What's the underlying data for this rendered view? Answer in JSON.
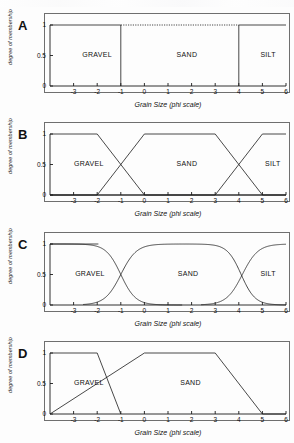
{
  "figure": {
    "background": "#fdfdfd",
    "line_color": "#1a1a1a",
    "frame_color": "#6f6f6f"
  },
  "axis": {
    "xlabel": "Grain Size (phi scale)",
    "ylabel": "degree of membership",
    "xticks": [
      "-3",
      "-2",
      "-1",
      "0",
      "1",
      "2",
      "3",
      "4",
      "5",
      "6"
    ],
    "xtick_values": [
      -3,
      -2,
      -1,
      0,
      1,
      2,
      3,
      4,
      5,
      6
    ],
    "yticks": [
      "0",
      "0.5",
      "1"
    ],
    "ytick_values": [
      0,
      0.5,
      1
    ],
    "xlim": [
      -4,
      6
    ],
    "ylim": [
      0,
      1
    ]
  },
  "panels": [
    {
      "id": "A",
      "letter": "A",
      "labels": [
        {
          "text": "GRAVEL",
          "x": -2.55,
          "y": 0.5
        },
        {
          "text": "SAND",
          "x": 1.45,
          "y": 0.5
        },
        {
          "text": "SILT",
          "x": 5.0,
          "y": 0.5
        }
      ]
    },
    {
      "id": "B",
      "letter": "B",
      "labels": [
        {
          "text": "GRAVEL",
          "x": -2.9,
          "y": 0.5
        },
        {
          "text": "SAND",
          "x": 1.45,
          "y": 0.5
        },
        {
          "text": "SILT",
          "x": 5.2,
          "y": 0.5
        }
      ]
    },
    {
      "id": "C",
      "letter": "C",
      "labels": [
        {
          "text": "GRAVEL",
          "x": -2.85,
          "y": 0.5
        },
        {
          "text": "SAND",
          "x": 1.5,
          "y": 0.5
        },
        {
          "text": "SILT",
          "x": 5.0,
          "y": 0.5
        }
      ]
    },
    {
      "id": "D",
      "letter": "D",
      "labels": [
        {
          "text": "GRAVEL",
          "x": -2.9,
          "y": 0.5
        },
        {
          "text": "SAND",
          "x": 1.6,
          "y": 0.5
        }
      ]
    }
  ],
  "chart_data": [
    {
      "type": "line",
      "panel": "A",
      "title": "A",
      "xlabel": "Grain Size (phi scale)",
      "ylabel": "degree of membership",
      "xlim": [
        -4,
        6
      ],
      "ylim": [
        0,
        1
      ],
      "grid": false,
      "legend": "none",
      "description": "Crisp (boolean) membership functions: rectangular sets with abrupt boundaries at -1 and 4 phi.",
      "series": [
        {
          "name": "GRAVEL",
          "style": "solid",
          "points": [
            [
              -4,
              1
            ],
            [
              -1,
              1
            ],
            [
              -1,
              0
            ],
            [
              6,
              0
            ]
          ]
        },
        {
          "name": "SAND",
          "style": "dotted-top",
          "points": [
            [
              -4,
              0
            ],
            [
              -1,
              0
            ],
            [
              -1,
              1
            ],
            [
              4,
              1
            ],
            [
              4,
              0
            ],
            [
              6,
              0
            ]
          ]
        },
        {
          "name": "SILT",
          "style": "solid",
          "points": [
            [
              -4,
              0
            ],
            [
              4,
              0
            ],
            [
              4,
              1
            ],
            [
              6,
              1
            ]
          ]
        }
      ]
    },
    {
      "type": "line",
      "panel": "B",
      "title": "B",
      "xlabel": "Grain Size (phi scale)",
      "ylabel": "degree of membership",
      "xlim": [
        -4,
        6
      ],
      "ylim": [
        0,
        1
      ],
      "grid": false,
      "legend": "none",
      "description": "Linear (trapezoidal) fuzzy membership functions with linear transition zones -2 to 0 and 3 to 5 phi.",
      "series": [
        {
          "name": "GRAVEL",
          "style": "solid",
          "points": [
            [
              -4,
              1
            ],
            [
              -2,
              1
            ],
            [
              0,
              0
            ],
            [
              6,
              0
            ]
          ]
        },
        {
          "name": "SAND",
          "style": "solid",
          "points": [
            [
              -4,
              0
            ],
            [
              -2,
              0
            ],
            [
              0,
              1
            ],
            [
              3,
              1
            ],
            [
              5,
              0
            ],
            [
              6,
              0
            ]
          ]
        },
        {
          "name": "SILT",
          "style": "solid",
          "points": [
            [
              -4,
              0
            ],
            [
              3,
              0
            ],
            [
              5,
              1
            ],
            [
              6,
              1
            ]
          ]
        }
      ]
    },
    {
      "type": "line",
      "panel": "C",
      "title": "C",
      "xlabel": "Grain Size (phi scale)",
      "ylabel": "degree of membership",
      "xlim": [
        -4,
        6
      ],
      "ylim": [
        0,
        1
      ],
      "grid": false,
      "legend": "none",
      "description": "Sigmoidal (S-shaped) fuzzy membership functions; crossovers at 0.5 membership near -1 and 4 phi.",
      "series": [
        {
          "name": "GRAVEL",
          "style": "sigmoid-falling",
          "crossover": -1.0,
          "slope": 3.2,
          "plateau_end": -1.9,
          "zero_at": 1.0
        },
        {
          "name": "SAND",
          "style": "sigmoid-bell",
          "rise_crossover": -1.0,
          "fall_crossover": 4.1,
          "rise_slope": 3.0,
          "fall_slope": 3.4,
          "plateau": [
            0.6,
            3.5
          ]
        },
        {
          "name": "SILT",
          "style": "sigmoid-rising",
          "crossover": 4.15,
          "slope": 3.0,
          "zero_at": 3.0,
          "plateau_start": 5.4
        }
      ]
    },
    {
      "type": "line",
      "panel": "D",
      "title": "D",
      "xlabel": "Grain Size (phi scale)",
      "ylabel": "degree of membership",
      "xlim": [
        -4,
        6
      ],
      "ylim": [
        0,
        1
      ],
      "grid": false,
      "legend": "none",
      "description": "Asymmetric linear membership functions; GRAVEL falls steeply from -2 to -1, SAND rises gradually from -4 to 0 and falls from 3 to 5.",
      "series": [
        {
          "name": "GRAVEL",
          "style": "solid",
          "points": [
            [
              -4,
              1
            ],
            [
              -2,
              1
            ],
            [
              -1,
              0
            ]
          ]
        },
        {
          "name": "SAND",
          "style": "solid",
          "points": [
            [
              -4,
              0
            ],
            [
              0,
              1
            ],
            [
              3,
              1
            ],
            [
              5,
              0
            ],
            [
              6,
              0
            ]
          ]
        }
      ]
    }
  ]
}
